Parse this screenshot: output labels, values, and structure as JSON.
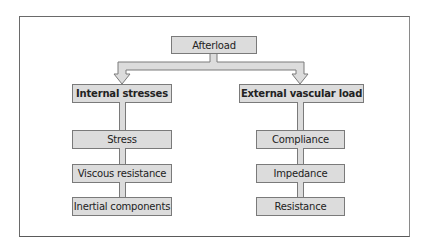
{
  "diagram": {
    "root": {
      "label": "Afterload"
    },
    "branches": [
      {
        "label": "Internal stresses",
        "children": [
          "Stress",
          "Viscous resistance",
          "Inertial components"
        ]
      },
      {
        "label": "External vascular load",
        "children": [
          "Compliance",
          "Impedance",
          "Resistance"
        ]
      }
    ]
  },
  "colors": {
    "box_fill": "#dcdcdc",
    "box_border": "#7a7a7a",
    "frame_border": "#6a6a6a",
    "text": "#222222"
  }
}
